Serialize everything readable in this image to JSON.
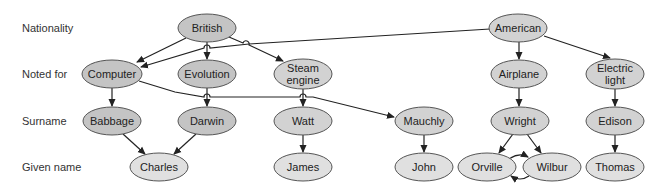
{
  "row_labels": [
    "Nationality",
    "Noted for",
    "Surname",
    "Given name"
  ],
  "nodes": {
    "british": {
      "label": "British",
      "lines": [
        "British"
      ],
      "x": 207,
      "y": 28,
      "rx": 29,
      "ry": 14,
      "fill": "#c4c4c4"
    },
    "american": {
      "label": "American",
      "lines": [
        "American"
      ],
      "x": 518,
      "y": 28,
      "rx": 29,
      "ry": 14,
      "fill": "#d2d2d2"
    },
    "computer": {
      "label": "Computer",
      "lines": [
        "Computer"
      ],
      "x": 112,
      "y": 74,
      "rx": 30,
      "ry": 14,
      "fill": "#c4c4c4"
    },
    "evolution": {
      "label": "Evolution",
      "lines": [
        "Evolution"
      ],
      "x": 207,
      "y": 74,
      "rx": 29,
      "ry": 14,
      "fill": "#c4c4c4"
    },
    "steam": {
      "label": "Steam engine",
      "lines": [
        "Steam",
        "engine"
      ],
      "x": 303,
      "y": 74,
      "rx": 29,
      "ry": 15,
      "fill": "#d2d2d2"
    },
    "airplane": {
      "label": "Airplane",
      "lines": [
        "Airplane"
      ],
      "x": 519,
      "y": 74,
      "rx": 28,
      "ry": 14,
      "fill": "#d2d2d2"
    },
    "electric": {
      "label": "Electric light",
      "lines": [
        "Electric",
        "light"
      ],
      "x": 615,
      "y": 74,
      "rx": 29,
      "ry": 15,
      "fill": "#d2d2d2"
    },
    "babbage": {
      "label": "Babbage",
      "lines": [
        "Babbage"
      ],
      "x": 112,
      "y": 121,
      "rx": 29,
      "ry": 14,
      "fill": "#c4c4c4"
    },
    "darwin": {
      "label": "Darwin",
      "lines": [
        "Darwin"
      ],
      "x": 207,
      "y": 121,
      "rx": 29,
      "ry": 14,
      "fill": "#c4c4c4"
    },
    "watt": {
      "label": "Watt",
      "lines": [
        "Watt"
      ],
      "x": 303,
      "y": 121,
      "rx": 29,
      "ry": 14,
      "fill": "#d2d2d2"
    },
    "mauchly": {
      "label": "Mauchly",
      "lines": [
        "Mauchly"
      ],
      "x": 424,
      "y": 121,
      "rx": 29,
      "ry": 14,
      "fill": "#d2d2d2"
    },
    "wright": {
      "label": "Wright",
      "lines": [
        "Wright"
      ],
      "x": 520,
      "y": 121,
      "rx": 29,
      "ry": 14,
      "fill": "#d2d2d2"
    },
    "edison": {
      "label": "Edison",
      "lines": [
        "Edison"
      ],
      "x": 615,
      "y": 121,
      "rx": 29,
      "ry": 14,
      "fill": "#d2d2d2"
    },
    "charles": {
      "label": "Charles",
      "lines": [
        "Charles"
      ],
      "x": 159,
      "y": 167,
      "rx": 29,
      "ry": 14,
      "fill": "#e0e0e0"
    },
    "james": {
      "label": "James",
      "lines": [
        "James"
      ],
      "x": 303,
      "y": 167,
      "rx": 29,
      "ry": 14,
      "fill": "#e0e0e0"
    },
    "john": {
      "label": "John",
      "lines": [
        "John"
      ],
      "x": 424,
      "y": 167,
      "rx": 29,
      "ry": 14,
      "fill": "#e0e0e0"
    },
    "orville": {
      "label": "Orville",
      "lines": [
        "Orville"
      ],
      "x": 487,
      "y": 167,
      "rx": 29,
      "ry": 14,
      "fill": "#e0e0e0"
    },
    "wilbur": {
      "label": "Wilbur",
      "lines": [
        "Wilbur"
      ],
      "x": 552,
      "y": 167,
      "rx": 29,
      "ry": 14,
      "fill": "#e0e0e0"
    },
    "thomas": {
      "label": "Thomas",
      "lines": [
        "Thomas"
      ],
      "x": 615,
      "y": 167,
      "rx": 29,
      "ry": 14,
      "fill": "#e0e0e0"
    }
  },
  "edges": [
    [
      "british",
      "computer"
    ],
    [
      "british",
      "evolution"
    ],
    [
      "british",
      "steam"
    ],
    [
      "american",
      "computer"
    ],
    [
      "american",
      "airplane"
    ],
    [
      "american",
      "electric"
    ],
    [
      "computer",
      "babbage"
    ],
    [
      "computer",
      "mauchly"
    ],
    [
      "evolution",
      "darwin"
    ],
    [
      "steam",
      "watt"
    ],
    [
      "airplane",
      "wright"
    ],
    [
      "electric",
      "edison"
    ],
    [
      "babbage",
      "charles"
    ],
    [
      "darwin",
      "charles"
    ],
    [
      "watt",
      "james"
    ],
    [
      "mauchly",
      "john"
    ],
    [
      "wright",
      "orville"
    ],
    [
      "wright",
      "wilbur"
    ],
    [
      "edison",
      "thomas"
    ],
    [
      "orville",
      "wilbur"
    ],
    [
      "wilbur",
      "orville"
    ]
  ],
  "colors": {
    "edge": "#222222",
    "outline": "#555555"
  }
}
